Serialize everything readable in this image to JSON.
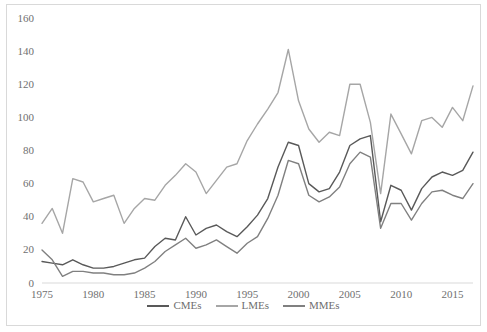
{
  "chart_data": {
    "type": "line",
    "title": "",
    "xlabel": "",
    "ylabel": "",
    "xlim": [
      1975,
      2017
    ],
    "ylim": [
      0,
      160
    ],
    "grid": false,
    "legend_position": "bottom",
    "x_tick_labels": [
      "1975",
      "1980",
      "1985",
      "1990",
      "1995",
      "2000",
      "2005",
      "2010",
      "2015"
    ],
    "x_ticks": [
      1975,
      1980,
      1985,
      1990,
      1995,
      2000,
      2005,
      2010,
      2015
    ],
    "y_tick_labels": [
      "0",
      "20",
      "40",
      "60",
      "80",
      "100",
      "120",
      "140",
      "160"
    ],
    "y_ticks": [
      0,
      20,
      40,
      60,
      80,
      100,
      120,
      140,
      160
    ],
    "x": [
      1975,
      1976,
      1977,
      1978,
      1979,
      1980,
      1981,
      1982,
      1983,
      1984,
      1985,
      1986,
      1987,
      1988,
      1989,
      1990,
      1991,
      1992,
      1993,
      1994,
      1995,
      1996,
      1997,
      1998,
      1999,
      2000,
      2001,
      2002,
      2003,
      2004,
      2005,
      2006,
      2007,
      2008,
      2009,
      2010,
      2011,
      2012,
      2013,
      2014,
      2015,
      2016,
      2017
    ],
    "series": [
      {
        "name": "CMEs",
        "color": "#595959",
        "values": [
          13,
          12,
          11,
          14,
          11,
          9,
          9,
          10,
          12,
          14,
          15,
          22,
          27,
          26,
          40,
          29,
          33,
          35,
          31,
          28,
          34,
          41,
          51,
          70,
          85,
          83,
          60,
          55,
          57,
          67,
          83,
          87,
          89,
          37,
          59,
          56,
          44,
          57,
          64,
          67,
          65,
          68,
          79
        ]
      },
      {
        "name": "LMEs",
        "color": "#a6a6a6",
        "values": [
          36,
          45,
          30,
          63,
          61,
          49,
          51,
          53,
          36,
          45,
          51,
          50,
          59,
          65,
          72,
          67,
          54,
          62,
          70,
          72,
          86,
          96,
          105,
          115,
          141,
          110,
          93,
          85,
          91,
          89,
          120,
          120,
          97,
          54,
          102,
          90,
          78,
          98,
          100,
          94,
          106,
          98,
          119
        ]
      },
      {
        "name": "MMEs",
        "color": "#808080",
        "values": [
          20,
          14,
          4,
          7,
          7,
          6,
          6,
          5,
          5,
          6,
          9,
          13,
          19,
          23,
          27,
          21,
          23,
          26,
          22,
          18,
          24,
          28,
          39,
          53,
          74,
          72,
          53,
          49,
          52,
          58,
          72,
          79,
          76,
          33,
          48,
          48,
          38,
          48,
          55,
          56,
          53,
          51,
          60
        ]
      }
    ]
  },
  "legend": {
    "entries": [
      {
        "label": "CMEs"
      },
      {
        "label": "LMEs"
      },
      {
        "label": "MMEs"
      }
    ]
  }
}
